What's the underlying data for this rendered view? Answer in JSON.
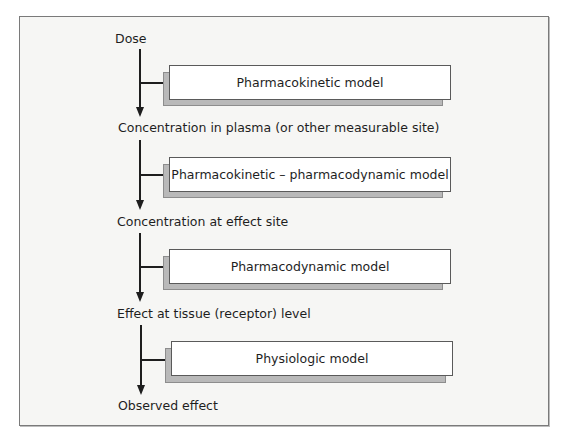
{
  "diagram": {
    "stages": [
      {
        "label": "Dose"
      },
      {
        "label": "Concentration in plasma (or other measurable site)"
      },
      {
        "label": "Concentration at effect site"
      },
      {
        "label": "Effect at tissue (receptor) level"
      },
      {
        "label": "Observed effect"
      }
    ],
    "models": [
      {
        "label": "Pharmacokinetic model"
      },
      {
        "label": "Pharmacokinetic – pharmacodynamic model"
      },
      {
        "label": "Pharmacodynamic model"
      },
      {
        "label": "Physiologic model"
      }
    ]
  }
}
